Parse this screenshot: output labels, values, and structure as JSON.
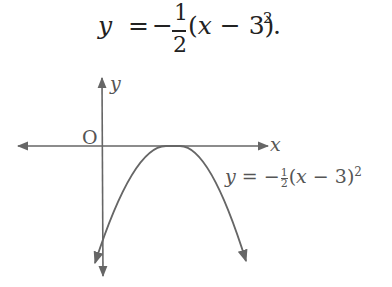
{
  "heading_equation": {
    "lhs": "y",
    "equals": "=",
    "sign": "−",
    "fraction": {
      "numerator": "1",
      "denominator": "2"
    },
    "body_open": "(",
    "var": "x",
    "body_rest": " − 3)",
    "exponent": "2",
    "terminator": "."
  },
  "graph": {
    "y_axis_label": "y",
    "x_axis_label": "x",
    "origin_label": "O",
    "curve_label": {
      "lhs": "y",
      "equals": "=",
      "sign": "−",
      "fraction": {
        "numerator": "1",
        "denominator": "2"
      },
      "body_open": "(",
      "var": "x",
      "body_rest": " − 3)",
      "exponent": "2"
    },
    "colors": {
      "axes": "#666666",
      "curve": "#666666",
      "text": "#555555"
    }
  }
}
